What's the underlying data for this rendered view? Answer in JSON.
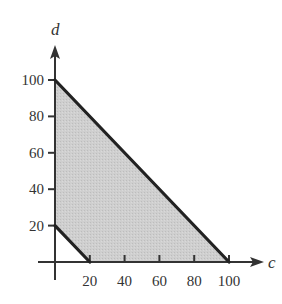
{
  "chart_data": {
    "type": "area",
    "title": "",
    "xlabel": "c",
    "ylabel": "d",
    "xlim": [
      0,
      100
    ],
    "ylim": [
      0,
      100
    ],
    "x_ticks": [
      20,
      40,
      60,
      80,
      100
    ],
    "y_ticks": [
      20,
      40,
      60,
      80,
      100
    ],
    "x_tick_labels": [
      "20",
      "40",
      "60",
      "80",
      "100"
    ],
    "y_tick_labels": [
      "20",
      "40",
      "60",
      "80",
      "100"
    ],
    "grid": false,
    "legend": null,
    "feasible_region": {
      "vertices": [
        [
          0,
          20
        ],
        [
          0,
          100
        ],
        [
          100,
          0
        ],
        [
          20,
          0
        ]
      ],
      "fill_color": "#c8c8c8"
    },
    "boundary_lines": [
      {
        "name": "c + d = 100",
        "from": [
          0,
          100
        ],
        "to": [
          100,
          0
        ]
      },
      {
        "name": "c + d = 20",
        "from": [
          0,
          20
        ],
        "to": [
          20,
          0
        ]
      }
    ]
  },
  "colors": {
    "axis": "#333333",
    "boundary": "#222222",
    "region": "#c8c8c8"
  }
}
